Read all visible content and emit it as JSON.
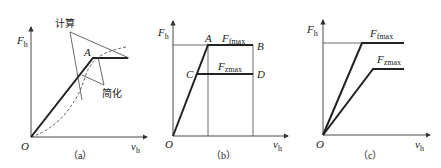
{
  "panels": [
    {
      "id": "a",
      "caption": "（a）",
      "y_axis_label": "F",
      "y_axis_sub": "h",
      "x_axis_label": "v",
      "x_axis_sub": "h",
      "origin_label": "O",
      "point_label_A": "A",
      "annotation_calc": "计算",
      "annotation_simplified": "简化"
    },
    {
      "id": "b",
      "caption": "（b）",
      "y_axis_label": "F",
      "y_axis_sub": "h",
      "x_axis_label": "v",
      "x_axis_sub": "h",
      "origin_label": "O",
      "point_A": "A",
      "point_B": "B",
      "point_C": "C",
      "point_D": "D",
      "fmax_label": "F",
      "fmax_sub": "fmax",
      "zmax_label": "F",
      "zmax_sub": "zmax"
    },
    {
      "id": "c",
      "caption": "（c）",
      "y_axis_label": "F",
      "y_axis_sub": "h",
      "x_axis_label": "v",
      "x_axis_sub": "h",
      "origin_label": "O",
      "fmax_label": "F",
      "fmax_sub": "fmax",
      "zmax_label": "F",
      "zmax_sub": "zmax"
    }
  ],
  "colors": {
    "line": "#222222",
    "thin": "#444444"
  }
}
